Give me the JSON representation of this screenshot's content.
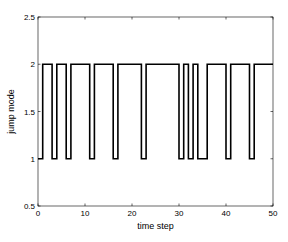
{
  "chart_data": {
    "type": "line",
    "subtype": "step",
    "title": "",
    "xlabel": "time step",
    "ylabel": "jump mode",
    "xlim": [
      0,
      50
    ],
    "ylim": [
      0.5,
      2.5
    ],
    "xticks": [
      0,
      10,
      20,
      30,
      40,
      50
    ],
    "yticks": [
      0.5,
      1,
      1.5,
      2,
      2.5
    ],
    "xtick_labels": [
      "0",
      "10",
      "20",
      "30",
      "40",
      "50"
    ],
    "ytick_labels": [
      "0.5",
      "1",
      "1.5",
      "2",
      "2.5"
    ],
    "grid": false,
    "legend": null,
    "line_color": "#000000",
    "segments": [
      {
        "start": 0,
        "end": 1,
        "mode": 1
      },
      {
        "start": 1,
        "end": 3,
        "mode": 2
      },
      {
        "start": 3,
        "end": 4,
        "mode": 1
      },
      {
        "start": 4,
        "end": 6,
        "mode": 2
      },
      {
        "start": 6,
        "end": 7,
        "mode": 1
      },
      {
        "start": 7,
        "end": 11,
        "mode": 2
      },
      {
        "start": 11,
        "end": 12,
        "mode": 1
      },
      {
        "start": 12,
        "end": 16,
        "mode": 2
      },
      {
        "start": 16,
        "end": 17,
        "mode": 1
      },
      {
        "start": 17,
        "end": 22,
        "mode": 2
      },
      {
        "start": 22,
        "end": 23,
        "mode": 1
      },
      {
        "start": 23,
        "end": 30,
        "mode": 2
      },
      {
        "start": 30,
        "end": 31,
        "mode": 1
      },
      {
        "start": 31,
        "end": 32,
        "mode": 2
      },
      {
        "start": 32,
        "end": 33,
        "mode": 1
      },
      {
        "start": 33,
        "end": 34,
        "mode": 2
      },
      {
        "start": 34,
        "end": 36,
        "mode": 1
      },
      {
        "start": 36,
        "end": 40,
        "mode": 2
      },
      {
        "start": 40,
        "end": 41,
        "mode": 1
      },
      {
        "start": 41,
        "end": 45,
        "mode": 2
      },
      {
        "start": 45,
        "end": 46,
        "mode": 1
      },
      {
        "start": 46,
        "end": 50,
        "mode": 2
      }
    ]
  }
}
